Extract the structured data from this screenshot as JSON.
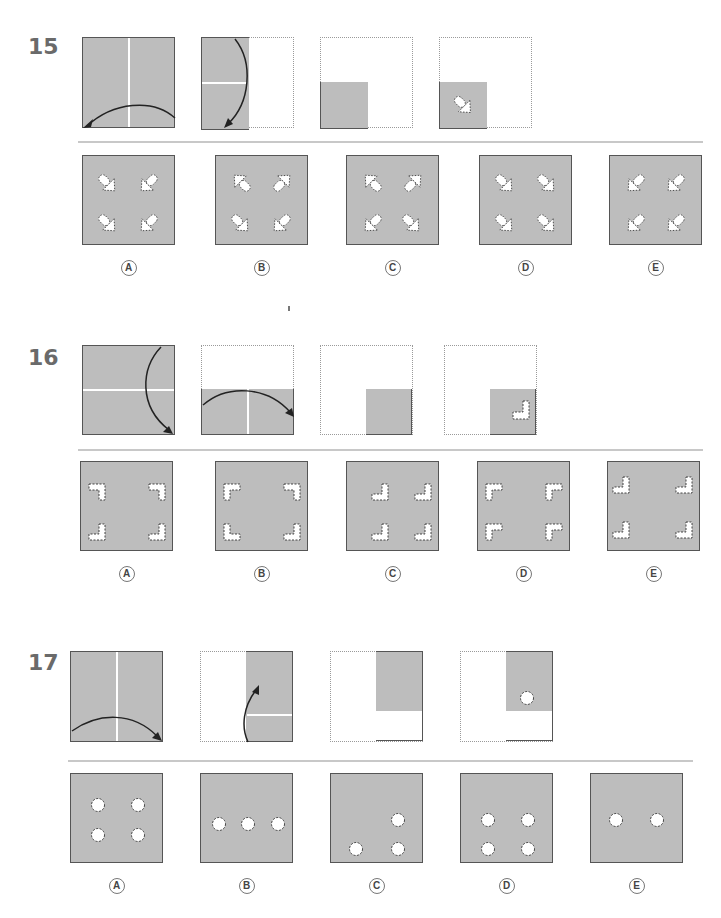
{
  "worksheet": {
    "title": "Paper folding puzzles",
    "option_labels": [
      "A",
      "B",
      "C",
      "D",
      "E"
    ]
  },
  "questions": [
    {
      "number": "15",
      "steps": [
        {
          "step": 1,
          "description": "Full square with vertical fold line; arrow folds right half over to the left"
        },
        {
          "step": 2,
          "description": "Left half remains with horizontal fold line; arrow folds top down to bottom"
        },
        {
          "step": 3,
          "description": "Folded to bottom-left quarter"
        },
        {
          "step": 4,
          "description": "Diagonal arrow-shaped hole punched in folded quarter"
        }
      ],
      "options": [
        {
          "label": "A",
          "description": "Four arrow holes: top-left points down-right, top-right points down-left, bottom-left points down-right, bottom-right points down-left"
        },
        {
          "label": "B",
          "description": "Four arrow holes pointing outward toward top corners on top row and toward center on bottom row"
        },
        {
          "label": "C",
          "description": "Four arrow holes: top row points up-left/up-right, bottom row points down-left/down-right"
        },
        {
          "label": "D",
          "description": "Four arrow holes all pointing down-right"
        },
        {
          "label": "E",
          "description": "Four arrow holes all pointing down-left"
        }
      ]
    },
    {
      "number": "16",
      "steps": [
        {
          "step": 1,
          "description": "Full square with horizontal fold line; arrow folds top half down"
        },
        {
          "step": 2,
          "description": "Bottom half remains with vertical fold line; arrow folds left half to right"
        },
        {
          "step": 3,
          "description": "Folded to bottom-right quarter"
        },
        {
          "step": 4,
          "description": "L-shaped hole punched in folded quarter"
        }
      ],
      "options": [
        {
          "label": "A",
          "description": "Four L-shaped holes: top row mirrored downward, bottom row upright"
        },
        {
          "label": "B",
          "description": "Four L-shaped holes mirrored toward each corner"
        },
        {
          "label": "C",
          "description": "Four identical L-shaped holes, same orientation"
        },
        {
          "label": "D",
          "description": "Four identical reversed L-shaped holes"
        },
        {
          "label": "E",
          "description": "Four identical L-shaped holes spread to corners"
        }
      ]
    },
    {
      "number": "17",
      "steps": [
        {
          "step": 1,
          "description": "Full square with vertical fold line; arrow folds left half to right"
        },
        {
          "step": 2,
          "description": "Right half remains with horizontal fold line; arrow folds bottom up"
        },
        {
          "step": 3,
          "description": "Folded to top-right quarter"
        },
        {
          "step": 4,
          "description": "Circular hole punched in folded quarter"
        }
      ],
      "options": [
        {
          "label": "A",
          "description": "Four circular holes in a 2x2 grid near center"
        },
        {
          "label": "B",
          "description": "Three circular holes in a horizontal row"
        },
        {
          "label": "C",
          "description": "Three circular holes in an L arrangement"
        },
        {
          "label": "D",
          "description": "Four circular holes in a 2x2 grid lower"
        },
        {
          "label": "E",
          "description": "Two circular holes in a horizontal row"
        }
      ]
    }
  ]
}
